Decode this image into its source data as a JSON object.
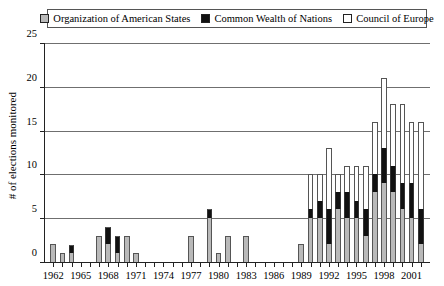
{
  "chart_data": {
    "type": "bar",
    "subtype": "stacked-vertical",
    "title": "",
    "xlabel": "",
    "ylabel": "# of elections monitored",
    "ylim": [
      0,
      25
    ],
    "ytick_values": [
      0,
      5,
      10,
      15,
      20,
      25
    ],
    "ytick_labels": [
      "0",
      "5",
      "10",
      "15",
      "20",
      "25"
    ],
    "grid": "horizontal",
    "legend_position": "top",
    "legend": [
      {
        "label": "Organization of American States",
        "key": "oas",
        "color": "#b9b9b9"
      },
      {
        "label": "Common Wealth of Nations",
        "key": "cwn",
        "color": "#111111"
      },
      {
        "label": "Council of Europe",
        "key": "coe",
        "color": "#ffffff"
      }
    ],
    "categories": [
      "1962",
      "1963",
      "1964",
      "1965",
      "1966",
      "1967",
      "1968",
      "1969",
      "1970",
      "1971",
      "1972",
      "1973",
      "1974",
      "1975",
      "1976",
      "1977",
      "1978",
      "1979",
      "1980",
      "1981",
      "1982",
      "1983",
      "1984",
      "1985",
      "1986",
      "1987",
      "1988",
      "1989",
      "1990",
      "1991",
      "1992",
      "1993",
      "1994",
      "1995",
      "1996",
      "1997",
      "1998",
      "1999",
      "2000",
      "2001",
      "2002"
    ],
    "xtick_labels": [
      "1962",
      "1965",
      "1968",
      "1971",
      "1974",
      "1977",
      "1980",
      "1983",
      "1986",
      "1989",
      "1992",
      "1995",
      "1998",
      "2001"
    ],
    "xtick_label_every": 3,
    "series": [
      {
        "name": "Organization of American States",
        "key": "oas",
        "color": "#b9b9b9",
        "values": [
          2,
          1,
          1,
          0,
          0,
          3,
          2,
          1,
          3,
          1,
          0,
          0,
          0,
          0,
          0,
          3,
          0,
          5,
          1,
          3,
          0,
          3,
          0,
          0,
          0,
          0,
          0,
          2,
          5,
          5,
          2,
          6,
          5,
          5,
          3,
          8,
          9,
          8,
          6,
          5,
          2
        ]
      },
      {
        "name": "Common Wealth of Nations",
        "key": "cwn",
        "color": "#111111",
        "values": [
          0,
          0,
          1,
          0,
          0,
          0,
          2,
          2,
          0,
          0,
          0,
          0,
          0,
          0,
          0,
          0,
          0,
          1,
          0,
          0,
          0,
          0,
          0,
          0,
          0,
          0,
          0,
          0,
          1,
          2,
          4,
          2,
          3,
          2,
          3,
          2,
          4,
          3,
          3,
          4,
          4
        ]
      },
      {
        "name": "Council of Europe",
        "key": "coe",
        "color": "#ffffff",
        "values": [
          0,
          0,
          0,
          0,
          0,
          0,
          0,
          0,
          0,
          0,
          0,
          0,
          0,
          0,
          0,
          0,
          0,
          0,
          0,
          0,
          0,
          0,
          0,
          0,
          0,
          0,
          0,
          0,
          4,
          3,
          7,
          2,
          3,
          4,
          5,
          6,
          8,
          7,
          9,
          7,
          10
        ]
      }
    ],
    "totals": [
      2,
      1,
      2,
      0,
      0,
      3,
      4,
      3,
      3,
      1,
      0,
      0,
      0,
      0,
      0,
      3,
      0,
      6,
      1,
      3,
      0,
      3,
      0,
      0,
      0,
      0,
      0,
      2,
      10,
      10,
      13,
      10,
      11,
      11,
      11,
      16,
      21,
      18,
      18,
      16,
      16
    ]
  }
}
